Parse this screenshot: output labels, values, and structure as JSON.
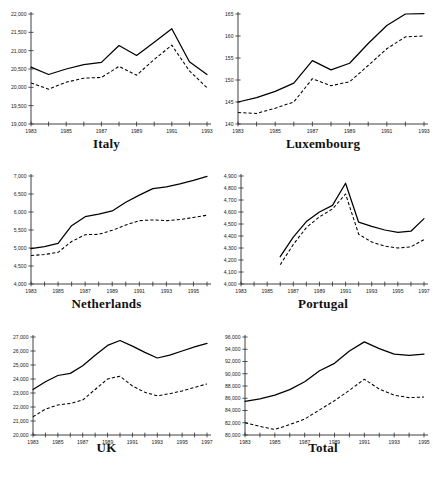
{
  "page": {
    "background": "#ffffff",
    "line_color": "#000000"
  },
  "charts": [
    {
      "key": "italy",
      "title": "Italy",
      "type": "line",
      "xlabel": "",
      "ylabel": "",
      "grid": false,
      "legend": "none",
      "xlim": [
        1983,
        1993
      ],
      "ylim": [
        19000,
        22000
      ],
      "ytick_step": 500,
      "yticks": [
        "19,000",
        "19,500",
        "20,000",
        "20,500",
        "21,000",
        "21,500",
        "22,000"
      ],
      "ytick_values": [
        19000,
        19500,
        20000,
        20500,
        21000,
        21500,
        22000
      ],
      "xticks": [
        "1983",
        "1985",
        "1987",
        "1989",
        "1991",
        "1993"
      ],
      "xtick_values": [
        1983,
        1985,
        1987,
        1989,
        1991,
        1993
      ],
      "x": [
        1983,
        1984,
        1985,
        1986,
        1987,
        1988,
        1989,
        1990,
        1991,
        1992,
        1993
      ],
      "series": [
        {
          "name": "solid",
          "style": "solid",
          "values": [
            20550,
            20350,
            20500,
            20620,
            20680,
            21140,
            20870,
            21230,
            21600,
            20700,
            20350
          ]
        },
        {
          "name": "dashed",
          "style": "dashed",
          "values": [
            20120,
            19950,
            20140,
            20250,
            20270,
            20570,
            20330,
            20760,
            21150,
            20450,
            19990
          ]
        }
      ]
    },
    {
      "key": "luxembourg",
      "title": "Luxembourg",
      "type": "line",
      "xlabel": "",
      "ylabel": "",
      "grid": false,
      "legend": "none",
      "xlim": [
        1983,
        1993
      ],
      "ylim": [
        140,
        165
      ],
      "ytick_step": 5,
      "yticks": [
        "140",
        "145",
        "150",
        "155",
        "160",
        "165"
      ],
      "ytick_values": [
        140,
        145,
        150,
        155,
        160,
        165
      ],
      "xticks": [
        "1983",
        "1985",
        "1987",
        "1989",
        "1991",
        "1993"
      ],
      "xtick_values": [
        1983,
        1985,
        1987,
        1989,
        1991,
        1993
      ],
      "x": [
        1983,
        1984,
        1985,
        1986,
        1987,
        1988,
        1989,
        1990,
        1991,
        1992,
        1993
      ],
      "series": [
        {
          "name": "solid",
          "style": "solid",
          "values": [
            145.0,
            146.0,
            147.4,
            149.3,
            154.4,
            152.3,
            153.8,
            158.3,
            162.4,
            165.0,
            165.1
          ]
        },
        {
          "name": "dashed",
          "style": "dashed",
          "values": [
            142.6,
            142.4,
            143.6,
            145.0,
            150.3,
            148.7,
            149.6,
            153.3,
            157.1,
            159.8,
            160.0
          ]
        }
      ]
    },
    {
      "key": "netherlands",
      "title": "Netherlands",
      "type": "line",
      "xlabel": "",
      "ylabel": "",
      "grid": false,
      "legend": "none",
      "xlim": [
        1983,
        1996
      ],
      "ylim": [
        4000,
        7000
      ],
      "ytick_step": 500,
      "yticks": [
        "4,000",
        "4,500",
        "5,000",
        "5,500",
        "6,000",
        "6,500",
        "7,000"
      ],
      "ytick_values": [
        4000,
        4500,
        5000,
        5500,
        6000,
        6500,
        7000
      ],
      "xticks": [
        "1983",
        "1985",
        "1987",
        "1989",
        "1991",
        "1993",
        "1995"
      ],
      "xtick_values": [
        1983,
        1985,
        1987,
        1989,
        1991,
        1993,
        1995
      ],
      "x": [
        1983,
        1984,
        1985,
        1986,
        1987,
        1988,
        1989,
        1990,
        1991,
        1992,
        1993,
        1994,
        1995,
        1996
      ],
      "series": [
        {
          "name": "solid",
          "style": "solid",
          "values": [
            4980,
            5040,
            5130,
            5620,
            5870,
            5940,
            6030,
            6270,
            6470,
            6650,
            6700,
            6780,
            6880,
            6990
          ]
        },
        {
          "name": "dashed",
          "style": "dashed",
          "values": [
            4790,
            4820,
            4880,
            5180,
            5370,
            5380,
            5490,
            5640,
            5760,
            5780,
            5760,
            5790,
            5850,
            5910
          ]
        }
      ]
    },
    {
      "key": "portugal",
      "title": "Portugal",
      "type": "line",
      "xlabel": "",
      "ylabel": "",
      "grid": false,
      "legend": "none",
      "xlim": [
        1983,
        1997
      ],
      "ylim": [
        4000,
        4900
      ],
      "ytick_step": 100,
      "yticks": [
        "4,000",
        "4,100",
        "4,200",
        "4,300",
        "4,400",
        "4,500",
        "4,600",
        "4,700",
        "4,800",
        "4,900"
      ],
      "ytick_values": [
        4000,
        4100,
        4200,
        4300,
        4400,
        4500,
        4600,
        4700,
        4800,
        4900
      ],
      "xticks": [
        "1983",
        "1985",
        "1987",
        "1989",
        "1991",
        "1993",
        "1995",
        "1997"
      ],
      "xtick_values": [
        1983,
        1985,
        1987,
        1989,
        1991,
        1993,
        1995,
        1997
      ],
      "x": [
        1986,
        1987,
        1988,
        1989,
        1990,
        1991,
        1992,
        1993,
        1994,
        1995,
        1996,
        1997
      ],
      "series": [
        {
          "name": "solid",
          "style": "solid",
          "values": [
            4228,
            4390,
            4520,
            4600,
            4655,
            4840,
            4515,
            4480,
            4450,
            4430,
            4440,
            4545
          ]
        },
        {
          "name": "dashed",
          "style": "dashed",
          "values": [
            4160,
            4330,
            4470,
            4560,
            4625,
            4750,
            4415,
            4350,
            4315,
            4300,
            4310,
            4370
          ]
        }
      ]
    },
    {
      "key": "uk",
      "title": "UK",
      "type": "line",
      "xlabel": "",
      "ylabel": "",
      "grid": false,
      "legend": "none",
      "xlim": [
        1983,
        1997
      ],
      "ylim": [
        20000,
        27000
      ],
      "ytick_step": 1000,
      "yticks": [
        "20,000",
        "21,000",
        "22,000",
        "23,000",
        "24,000",
        "25,000",
        "26,000",
        "27,000"
      ],
      "ytick_values": [
        20000,
        21000,
        22000,
        23000,
        24000,
        25000,
        26000,
        27000
      ],
      "xticks": [
        "1983",
        "1985",
        "1987",
        "1989",
        "1991",
        "1993",
        "1995",
        "1997"
      ],
      "xtick_values": [
        1983,
        1985,
        1987,
        1989,
        1991,
        1993,
        1995,
        1997
      ],
      "x": [
        1983,
        1984,
        1985,
        1986,
        1987,
        1988,
        1989,
        1990,
        1991,
        1992,
        1993,
        1994,
        1995,
        1996,
        1997
      ],
      "series": [
        {
          "name": "solid",
          "style": "solid",
          "values": [
            23250,
            23800,
            24250,
            24400,
            24950,
            25700,
            26400,
            26750,
            26350,
            25900,
            25500,
            25700,
            26000,
            26300,
            26550
          ]
        },
        {
          "name": "dashed",
          "style": "dashed",
          "values": [
            21300,
            21850,
            22150,
            22250,
            22500,
            23250,
            24000,
            24200,
            23500,
            23050,
            22800,
            22950,
            23150,
            23400,
            23650
          ]
        }
      ]
    },
    {
      "key": "total",
      "title": "Total",
      "type": "line",
      "xlabel": "",
      "ylabel": "",
      "grid": false,
      "legend": "none",
      "xlim": [
        1983,
        1995
      ],
      "ylim": [
        80000,
        96000
      ],
      "ytick_step": 2000,
      "yticks": [
        "80,000",
        "82,000",
        "84,000",
        "86,000",
        "88,000",
        "90,000",
        "92,000",
        "94,000",
        "96,000"
      ],
      "ytick_values": [
        80000,
        82000,
        84000,
        86000,
        88000,
        90000,
        92000,
        94000,
        96000
      ],
      "xticks": [
        "1983",
        "1985",
        "1987",
        "1989",
        "1991",
        "1993",
        "1995"
      ],
      "xtick_values": [
        1983,
        1985,
        1987,
        1989,
        1991,
        1993,
        1995
      ],
      "x": [
        1983,
        1984,
        1985,
        1986,
        1987,
        1988,
        1989,
        1990,
        1991,
        1992,
        1993,
        1994,
        1995
      ],
      "series": [
        {
          "name": "solid",
          "style": "solid",
          "values": [
            85500,
            85900,
            86500,
            87400,
            88700,
            90500,
            91700,
            93700,
            95200,
            94100,
            93200,
            93000,
            93200
          ]
        },
        {
          "name": "dashed",
          "style": "dashed",
          "values": [
            82000,
            81400,
            80900,
            81700,
            82600,
            84100,
            85600,
            87300,
            89100,
            87500,
            86500,
            86100,
            86200
          ]
        }
      ]
    }
  ]
}
